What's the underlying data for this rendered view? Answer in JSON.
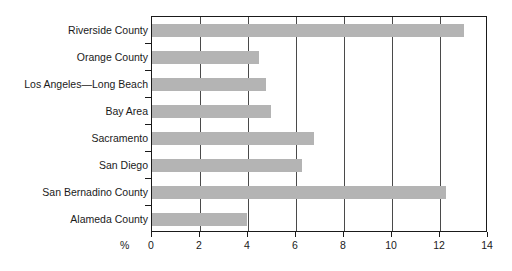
{
  "chart_data": {
    "type": "bar",
    "orientation": "horizontal",
    "title": "",
    "subtitle": "",
    "xlabel": "%",
    "ylabel": "",
    "categories": [
      "Riverside County",
      "Orange County",
      "Los Angeles—Long Beach",
      "Bay Area",
      "Sacramento",
      "San Diego",
      "San Bernadino County",
      "Alameda County"
    ],
    "values": [
      13.0,
      4.45,
      4.75,
      4.95,
      6.75,
      6.25,
      12.25,
      3.95
    ],
    "xlim": [
      0,
      14
    ],
    "xticks": [
      0,
      2,
      4,
      6,
      8,
      10,
      12,
      14
    ],
    "xtick_labels": [
      "0",
      "2",
      "4",
      "6",
      "8",
      "10",
      "12",
      "14"
    ],
    "grid": "vertical",
    "legend": "none",
    "bar_color": "#b4b4b4",
    "axis_color": "#1a1a1a",
    "gridline_color": "#4a4a4a",
    "background_color": "#ffffff"
  }
}
